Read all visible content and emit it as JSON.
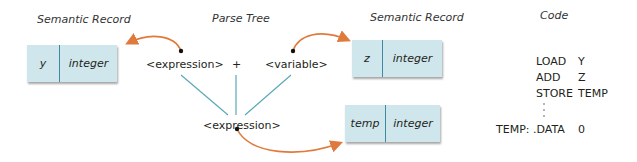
{
  "headers": {
    "semantic_record_left": "Semantic Record",
    "parse_tree": "Parse Tree",
    "semantic_record_right": "Semantic Record",
    "code": "Code"
  },
  "records": [
    {
      "name": "y",
      "type": "integer"
    },
    {
      "name": "z",
      "type": "integer"
    },
    {
      "name": "temp",
      "type": "integer"
    }
  ],
  "parse_tree": {
    "left": "<expression>",
    "op": "+",
    "right": "<variable>",
    "root": "<expression>"
  },
  "code": {
    "lines": [
      {
        "label": "",
        "op": "LOAD",
        "arg": "Y"
      },
      {
        "label": "",
        "op": "ADD",
        "arg": "Z"
      },
      {
        "label": "",
        "op": "STORE",
        "arg": "TEMP"
      },
      {
        "label": "TEMP:",
        "op": ".DATA",
        "arg": "0"
      }
    ]
  },
  "colors": {
    "record_fill": "#cfe6ec",
    "record_divider": "#3f8aa0",
    "tree_line": "#5aa9b5",
    "arrow": "#e07a3c"
  }
}
